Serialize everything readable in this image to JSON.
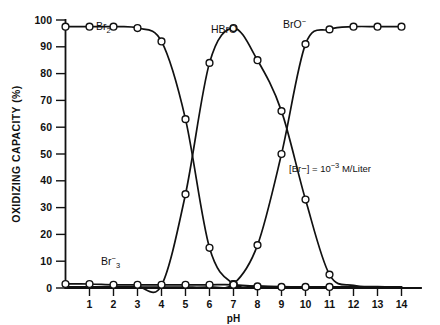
{
  "chart_data": {
    "type": "line",
    "title": "",
    "xlabel": "pH",
    "ylabel": "OXIDIZING CAPACITY (%)",
    "xlim": [
      0,
      14
    ],
    "ylim": [
      0,
      100
    ],
    "xticks": [
      "1",
      "2",
      "3",
      "4",
      "5",
      "6",
      "7",
      "8",
      "9",
      "10",
      "11",
      "12",
      "13",
      "14"
    ],
    "yticks": [
      "0",
      "10",
      "20",
      "30",
      "40",
      "50",
      "60",
      "70",
      "80",
      "90",
      "100"
    ],
    "grid": false,
    "legend_position": "inline-annotations",
    "x": [
      0,
      1,
      2,
      3,
      4,
      5,
      6,
      7,
      8,
      9,
      10,
      11,
      12,
      13,
      14
    ],
    "series": [
      {
        "name": "Br2",
        "label": "Br",
        "label_sub": "2",
        "values": [
          97.5,
          97.5,
          97.5,
          97,
          92,
          63,
          15,
          1.5,
          0.8,
          0.5,
          0.4,
          0.4,
          0.4,
          0.4,
          0.4
        ]
      },
      {
        "name": "HBrO",
        "label": "HBrO",
        "values": [
          0.4,
          0.4,
          0.4,
          0.5,
          1,
          35,
          84,
          97,
          85,
          66,
          33,
          5,
          1,
          0.5,
          0.4
        ]
      },
      {
        "name": "BrO-",
        "label": "BrO",
        "label_sup": "−",
        "values": [
          0.3,
          0.3,
          0.3,
          0.3,
          0.3,
          0.3,
          0.4,
          1.5,
          16,
          50,
          91,
          96.5,
          97.5,
          97.5,
          97.5
        ]
      },
      {
        "name": "Br3-",
        "label": "Br",
        "label_sup": "−",
        "label_sub": "3",
        "values": [
          1.5,
          1.5,
          1.2,
          1.2,
          1.2,
          1.2,
          1.2,
          1.2,
          0.6,
          0.4,
          0.4,
          0.4,
          0.3,
          0.3,
          0.3
        ]
      }
    ],
    "annotations": [
      {
        "name": "concentration-note",
        "text": "[Br−] = 10",
        "sup": "−3",
        "tail": " M/Liter"
      }
    ],
    "series_labels": {
      "br2": "Br₂",
      "hbro": "HBrO",
      "bro_minus": "BrO⁻",
      "br3_minus": "Br₃⁻"
    }
  }
}
